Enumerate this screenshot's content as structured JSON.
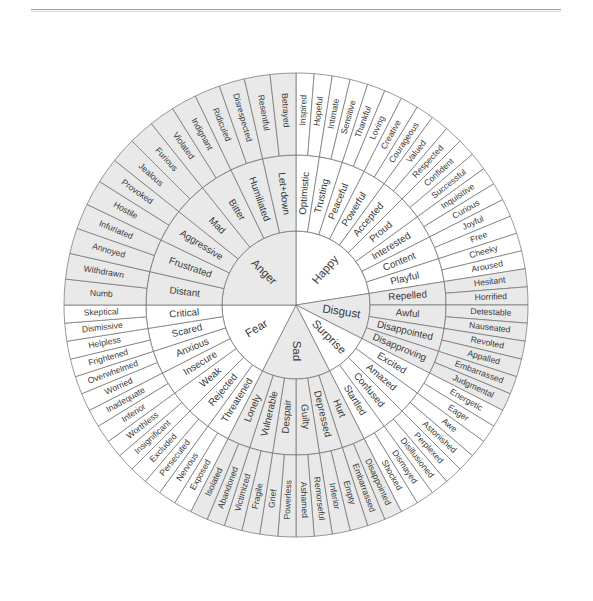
{
  "header": {
    "title": "EMOTION WHEEL"
  },
  "figure": {
    "name": "emotion-wheel",
    "center_x": 296,
    "center_y": 305,
    "radii": {
      "core": 74,
      "mid": 150,
      "outer": 232
    },
    "colors": {
      "shade": "#e9e9e9",
      "plain": "#ffffff",
      "stroke": "#6f6f6f",
      "label": "#3a3a3a"
    }
  },
  "chart_data": {
    "type": "pie",
    "title": "Emotion Wheel",
    "rings": [
      "core",
      "secondary",
      "tertiary"
    ],
    "sectors": [
      {
        "core": "Happy",
        "shaded": false,
        "start_deg": -90,
        "span_deg": 81,
        "secondary": [
          {
            "label": "Optimistic",
            "tertiary": [
              "Inspired",
              "Hopeful"
            ]
          },
          {
            "label": "Trusting",
            "tertiary": [
              "Intimate",
              "Sensitive"
            ]
          },
          {
            "label": "Peaceful",
            "tertiary": [
              "Thankful",
              "Loving"
            ]
          },
          {
            "label": "Powerful",
            "tertiary": [
              "Creative",
              "Courageous"
            ]
          },
          {
            "label": "Accepted",
            "tertiary": [
              "Valued",
              "Respected"
            ]
          },
          {
            "label": "Proud",
            "tertiary": [
              "Confident",
              "Successful"
            ]
          },
          {
            "label": "Interested",
            "tertiary": [
              "Inquisitive",
              "Curious"
            ]
          },
          {
            "label": "Content",
            "tertiary": [
              "Joyful",
              "Free"
            ]
          },
          {
            "label": "Playful",
            "tertiary": [
              "Cheeky",
              "Aroused"
            ]
          }
        ]
      },
      {
        "core": "Disgust",
        "shaded": true,
        "start_deg": -9,
        "span_deg": 36,
        "secondary": [
          {
            "label": "Repelled",
            "tertiary": [
              "Hesitant",
              "Horrified"
            ]
          },
          {
            "label": "Awful",
            "tertiary": [
              "Detestable",
              "Nauseated"
            ]
          },
          {
            "label": "Disappointed",
            "tertiary": [
              "Revolted",
              "Appalled"
            ]
          },
          {
            "label": "Disapproving",
            "tertiary": [
              "Embarrassed",
              "Judgmental"
            ]
          }
        ]
      },
      {
        "core": "Surprise",
        "shaded": false,
        "start_deg": 27,
        "span_deg": 36,
        "secondary": [
          {
            "label": "Excited",
            "tertiary": [
              "Energetic",
              "Eager"
            ]
          },
          {
            "label": "Amazed",
            "tertiary": [
              "Awe",
              "Astonished"
            ]
          },
          {
            "label": "Confused",
            "tertiary": [
              "Perplexed",
              "Disillusioned"
            ]
          },
          {
            "label": "Startled",
            "tertiary": [
              "Dismayed",
              "Shocked"
            ]
          }
        ]
      },
      {
        "core": "Sad",
        "shaded": true,
        "start_deg": 63,
        "span_deg": 54,
        "secondary": [
          {
            "label": "Hurt",
            "tertiary": [
              "Disappointed",
              "Embarrassed"
            ]
          },
          {
            "label": "Depressed",
            "tertiary": [
              "Empty",
              "Inferior"
            ]
          },
          {
            "label": "Guilty",
            "tertiary": [
              "Remorseful",
              "Ashamed"
            ]
          },
          {
            "label": "Despair",
            "tertiary": [
              "Powerless",
              "Grief"
            ]
          },
          {
            "label": "Vulnerable",
            "tertiary": [
              "Fragile",
              "Victimized"
            ]
          },
          {
            "label": "Lonely",
            "tertiary": [
              "Abandoned",
              "Isolated"
            ]
          }
        ]
      },
      {
        "core": "Fear",
        "shaded": false,
        "start_deg": 117,
        "span_deg": 63,
        "secondary": [
          {
            "label": "Threatened",
            "tertiary": [
              "Exposed",
              "Nervous"
            ]
          },
          {
            "label": "Rejected",
            "tertiary": [
              "Persecuted",
              "Excluded"
            ]
          },
          {
            "label": "Weak",
            "tertiary": [
              "Insignificant",
              "Worthless"
            ]
          },
          {
            "label": "Insecure",
            "tertiary": [
              "Inferior",
              "Inadequate"
            ]
          },
          {
            "label": "Anxious",
            "tertiary": [
              "Worried",
              "Overwhelmed"
            ]
          },
          {
            "label": "Scared",
            "tertiary": [
              "Frightened",
              "Helpless"
            ]
          },
          {
            "label": "Critical",
            "tertiary": [
              "Dismissive",
              "Skeptical"
            ]
          }
        ]
      },
      {
        "core": "Anger",
        "shaded": true,
        "start_deg": 180,
        "span_deg": 90,
        "secondary": [
          {
            "label": "Distant",
            "tertiary": [
              "Numb",
              "Withdrawn"
            ]
          },
          {
            "label": "Frustrated",
            "tertiary": [
              "Annoyed",
              "Infuriated"
            ]
          },
          {
            "label": "Aggressive",
            "tertiary": [
              "Hostile",
              "Provoked"
            ]
          },
          {
            "label": "Mad",
            "tertiary": [
              "Jealous",
              "Furious"
            ]
          },
          {
            "label": "Bitter",
            "tertiary": [
              "Violated",
              "Indignant"
            ]
          },
          {
            "label": "Humiliated",
            "tertiary": [
              "Ridiculed",
              "Disrespected"
            ]
          },
          {
            "label": "Let+down",
            "tertiary": [
              "Resentful",
              "Betrayed"
            ]
          }
        ]
      }
    ]
  }
}
